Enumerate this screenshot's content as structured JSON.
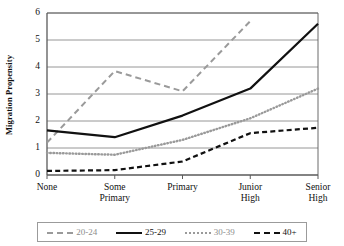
{
  "chart_data": {
    "type": "line",
    "title": "",
    "xlabel": "",
    "ylabel": "Migration Propensity",
    "categories": [
      "None",
      "Some Primary",
      "Primary",
      "Junior High",
      "Senior High"
    ],
    "category_lines": [
      [
        "None"
      ],
      [
        "Some",
        "Primary"
      ],
      [
        "Primary"
      ],
      [
        "Junior",
        "High"
      ],
      [
        "Senior",
        "High"
      ]
    ],
    "ylim": [
      0,
      6
    ],
    "yticks": [
      0,
      1,
      2,
      3,
      4,
      5,
      6
    ],
    "grid": "horizontal",
    "legend_position": "bottom",
    "series": [
      {
        "name": "20-24",
        "style": "dashed",
        "color": "#9a9a9a",
        "values": [
          1.2,
          3.85,
          3.1,
          5.7,
          null
        ]
      },
      {
        "name": "25-29",
        "style": "solid",
        "color": "#111111",
        "values": [
          1.65,
          1.4,
          2.2,
          3.2,
          5.6
        ]
      },
      {
        "name": "30-39",
        "style": "dotted",
        "color": "#9a9a9a",
        "values": [
          0.82,
          0.75,
          1.3,
          2.1,
          3.2
        ]
      },
      {
        "name": "40+",
        "style": "dashed",
        "color": "#111111",
        "values": [
          0.15,
          0.18,
          0.5,
          1.55,
          1.75
        ]
      }
    ]
  },
  "legend": {
    "items": [
      {
        "label": "20-24"
      },
      {
        "label": "25-29"
      },
      {
        "label": "30-39"
      },
      {
        "label": "40+"
      }
    ]
  }
}
